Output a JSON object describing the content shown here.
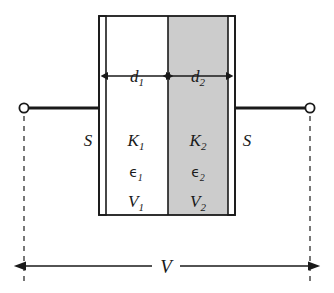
{
  "figure": {
    "name": "parallel-plate-capacitor-with-two-dielectrics",
    "background_color": "#ffffff",
    "line_color": "#1a1a1a",
    "dielectric1_fill": "#ffffff",
    "dielectric2_fill": "#cccccc",
    "plate_fill": "#ffffff"
  },
  "labels": {
    "d1": "d",
    "d1_sub": "1",
    "d2": "d",
    "d2_sub": "2",
    "K1": "K",
    "K1_sub": "1",
    "K2": "K",
    "K2_sub": "2",
    "eps1": "ϵ",
    "eps1_sub": "1",
    "eps2": "ϵ",
    "eps2_sub": "2",
    "V1": "V",
    "V1_sub": "1",
    "V2": "V",
    "V2_sub": "2",
    "S_left": "S",
    "S_right": "S",
    "V_total": "V"
  },
  "geometry": {
    "box_left": 99,
    "box_right": 235,
    "box_top": 16,
    "box_bottom": 215,
    "left_plate_inner": 106,
    "right_plate_inner": 228,
    "dielectric_boundary": 168,
    "wire_y": 108,
    "terminal_left_x": 24,
    "terminal_right_x": 310,
    "dimension_line_y": 266,
    "d_arrow_y": 76
  }
}
